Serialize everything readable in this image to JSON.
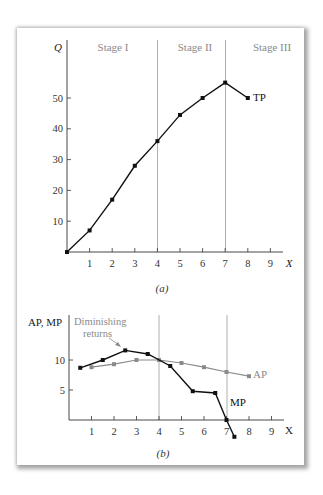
{
  "chart_data": [
    {
      "id": "a",
      "type": "line",
      "caption": "(a)",
      "xlabel": "X",
      "ylabel": "Q",
      "xlim": [
        0,
        9
      ],
      "ylim": [
        0,
        55
      ],
      "x_ticks": [
        1,
        2,
        3,
        4,
        5,
        6,
        7,
        8,
        9
      ],
      "y_ticks": [
        10,
        20,
        30,
        40,
        50
      ],
      "stage_dividers": [
        4,
        7
      ],
      "stage_labels": [
        "Stage I",
        "Stage II",
        "Stage III"
      ],
      "grid": false,
      "series": [
        {
          "name": "TP",
          "color": "#111111",
          "x": [
            0,
            1,
            2,
            3,
            4,
            5,
            6,
            7,
            8
          ],
          "values": [
            0,
            7,
            17,
            28,
            36,
            44.5,
            50,
            55,
            50
          ]
        }
      ]
    },
    {
      "id": "b",
      "type": "line",
      "caption": "(b)",
      "xlabel": "X",
      "ylabel": "AP, MP",
      "xlim": [
        0,
        9
      ],
      "ylim": [
        -3,
        12
      ],
      "x_ticks": [
        1,
        2,
        3,
        4,
        5,
        6,
        7,
        8,
        9
      ],
      "y_ticks": [
        5,
        10
      ],
      "stage_dividers": [
        4,
        7
      ],
      "grid": false,
      "annotations": [
        {
          "text": "Diminishing returns",
          "points_to": [
            2.5,
            11.6
          ],
          "color": "#8a8a8a"
        }
      ],
      "series": [
        {
          "name": "MP",
          "color": "#111111",
          "x": [
            0.5,
            1.5,
            2.5,
            3.5,
            4.5,
            5.5,
            6.5,
            7,
            7.35
          ],
          "values": [
            8.7,
            10,
            11.6,
            11,
            9,
            4.8,
            4.5,
            0,
            -2.8
          ]
        },
        {
          "name": "AP",
          "color": "#8a8a8a",
          "x": [
            1,
            2,
            3,
            4,
            5,
            6,
            7,
            8
          ],
          "values": [
            8.8,
            9.3,
            10,
            10,
            9.5,
            8.8,
            8,
            7.3
          ]
        }
      ]
    }
  ],
  "labels": {
    "chart_a": {
      "ylabel": "Q",
      "xlabel": "X",
      "caption": "(a)",
      "stage1": "Stage I",
      "stage2": "Stage II",
      "stage3": "Stage III",
      "series_tp": "TP",
      "y_ticks": [
        "10",
        "20",
        "30",
        "40",
        "50"
      ],
      "x_ticks": [
        "1",
        "2",
        "3",
        "4",
        "5",
        "6",
        "7",
        "8",
        "9"
      ]
    },
    "chart_b": {
      "ylabel": "AP, MP",
      "xlabel": "X",
      "caption": "(b)",
      "annot_line1": "Diminishing",
      "annot_line2": "returns",
      "series_ap": "AP",
      "series_mp": "MP",
      "y_ticks": [
        "5",
        "10"
      ],
      "x_ticks": [
        "1",
        "2",
        "3",
        "4",
        "5",
        "6",
        "7",
        "8",
        "9"
      ]
    }
  }
}
